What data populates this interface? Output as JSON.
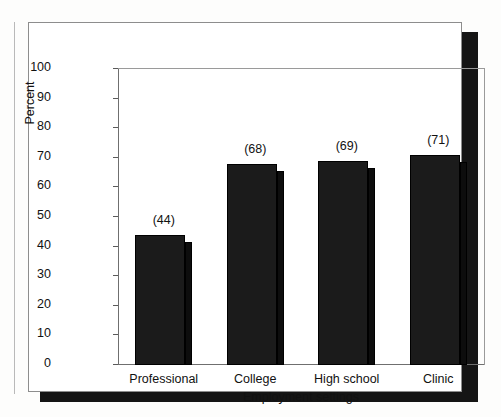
{
  "figure": {
    "background_color": "#ffffff",
    "shadow_color": "#151515",
    "bar_color": "#1b1b1b",
    "axis_color": "#6f6f6f"
  },
  "chart_data": {
    "type": "bar",
    "title": "",
    "xlabel": "Employment settings",
    "ylabel": "Percent",
    "categories": [
      "Professional",
      "College",
      "High school",
      "Clinic"
    ],
    "values": [
      44,
      68,
      69,
      71
    ],
    "data_labels": [
      "(44)",
      "(68)",
      "(69)",
      "(71)"
    ],
    "ylim": [
      0,
      100
    ],
    "yticks": [
      0,
      10,
      20,
      30,
      40,
      50,
      60,
      70,
      80,
      90,
      100
    ],
    "ytick_labels": [
      "0",
      "10",
      "20",
      "30",
      "40",
      "50",
      "60",
      "70",
      "80",
      "90",
      "100"
    ],
    "grid": false,
    "legend": false,
    "style": "3d-bar"
  }
}
